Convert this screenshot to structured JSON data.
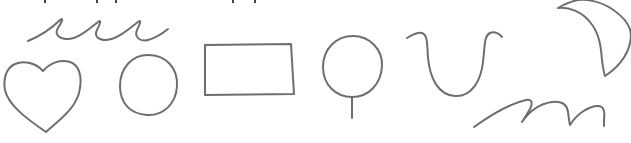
{
  "image": {
    "description": "Hand-drawn line sketches of simple shapes on white paper",
    "background_color": "#ffffff",
    "stroke_color": "#6e6e6e",
    "stroke_width": 2
  },
  "shapes": [
    {
      "name": "wave-scribble",
      "label": "Wavy line with three loops"
    },
    {
      "name": "heart",
      "label": "Heart"
    },
    {
      "name": "circle",
      "label": "Circle"
    },
    {
      "name": "rectangle",
      "label": "Rectangle"
    },
    {
      "name": "lollipop",
      "label": "Circle on a stick"
    },
    {
      "name": "u-curve",
      "label": "U-shaped curve"
    },
    {
      "name": "crescent",
      "label": "Crescent moon"
    },
    {
      "name": "m-scribble",
      "label": "Cursive m-like scribble"
    }
  ]
}
